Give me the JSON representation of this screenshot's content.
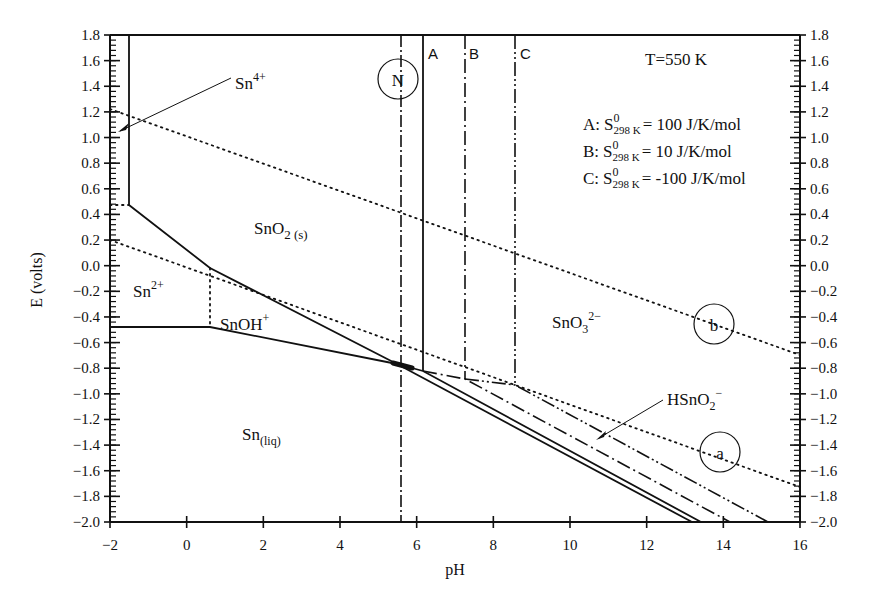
{
  "chart_data": {
    "type": "line",
    "title": "",
    "subtitle": "E–pH (Pourbaix) diagram of Sn, T=550 K",
    "xlabel": "pH",
    "ylabel": "E (volts)",
    "xlim": [
      -2,
      16
    ],
    "ylim": [
      -2.0,
      1.8
    ],
    "x_ticks": [
      "-2",
      "0",
      "2",
      "4",
      "6",
      "8",
      "10",
      "12",
      "14",
      "16"
    ],
    "y_ticks": [
      "1.8",
      "1.6",
      "1.4",
      "1.2",
      "1.0",
      "0.8",
      "0.6",
      "0.4",
      "0.2",
      "0.0",
      "-0.2",
      "-0.4",
      "-0.6",
      "-0.8",
      "-1.0",
      "-1.2",
      "-1.4",
      "-1.6",
      "-1.8",
      "-2.0"
    ],
    "grid": false,
    "annotations": {
      "temperature": "T=550 K",
      "neutral_label": "N",
      "water_line_a": "a",
      "water_line_b": "b",
      "line_labels": [
        "A",
        "B",
        "C"
      ],
      "legend": [
        {
          "key": "A:",
          "text": "= 100 J/K/mol"
        },
        {
          "key": "B:",
          "text": "= 10 J/K/mol"
        },
        {
          "key": "C:",
          "text": "= -100 J/K/mol"
        }
      ],
      "entropy_symbol": "S",
      "entropy_sup": "0",
      "entropy_sub": "298 K"
    },
    "regions": [
      {
        "name": "Sn4+",
        "base": "Sn",
        "sup": "4+"
      },
      {
        "name": "SnO2(s)",
        "base": "SnO",
        "sub": "2 (s)"
      },
      {
        "name": "Sn2+",
        "base": "Sn",
        "sup": "2+"
      },
      {
        "name": "SnOH+",
        "base": "SnOH",
        "sup": "+"
      },
      {
        "name": "Sn(liq)",
        "base": "Sn",
        "sub": "(liq)"
      },
      {
        "name": "SnO3 2-",
        "base": "SnO",
        "sub": "3",
        "sup": "2−"
      },
      {
        "name": "HSnO2-",
        "base": "HSnO",
        "sub": "2",
        "sup": "−"
      }
    ],
    "series": [
      {
        "name": "Sn4+/SnO2 boundary",
        "style": "solid",
        "points": [
          [
            -1.5,
            1.8
          ],
          [
            -1.5,
            0.47
          ]
        ]
      },
      {
        "name": "Sn2+/SnO2 boundary",
        "style": "solid",
        "points": [
          [
            -1.5,
            0.47
          ],
          [
            0.6,
            0.02
          ],
          [
            5.5,
            -0.77
          ]
        ]
      },
      {
        "name": "Sn2+/Sn boundary",
        "style": "solid",
        "points": [
          [
            -2,
            -0.5
          ],
          [
            0.6,
            -0.5
          ],
          [
            5.5,
            -0.77
          ]
        ]
      },
      {
        "name": "Sn2+/SnOH+ boundary",
        "style": "dotted",
        "points": [
          [
            0.6,
            0.02
          ],
          [
            0.6,
            -0.5
          ]
        ]
      },
      {
        "name": "water line b (O2/H2O)",
        "style": "dotted",
        "points": [
          [
            -2,
            1.22
          ],
          [
            16,
            -0.7
          ]
        ]
      },
      {
        "name": "water line a (H+/H2)",
        "style": "dotted",
        "points": [
          [
            -2,
            0.2
          ],
          [
            16,
            -1.73
          ]
        ]
      },
      {
        "name": "A: SnO2/SnO3 2- vertical",
        "style": "solid",
        "points": [
          [
            6.15,
            1.8
          ],
          [
            6.15,
            -0.82
          ]
        ]
      },
      {
        "name": "A: SnO3 2-/Sn boundary",
        "style": "solid",
        "points": [
          [
            5.5,
            -0.77
          ],
          [
            6.15,
            -0.82
          ],
          [
            13.25,
            -2.0
          ]
        ]
      },
      {
        "name": "A: HSnO2- lower boundary",
        "style": "solid",
        "points": [
          [
            5.5,
            -0.77
          ],
          [
            13.0,
            -2.0
          ]
        ]
      },
      {
        "name": "B: vertical",
        "style": "dash-dot",
        "points": [
          [
            7.25,
            1.8
          ],
          [
            7.25,
            -0.88
          ]
        ]
      },
      {
        "name": "B: boundary",
        "style": "dash-dot",
        "points": [
          [
            6.15,
            -0.82
          ],
          [
            7.25,
            -0.88
          ],
          [
            14.0,
            -2.0
          ]
        ]
      },
      {
        "name": "C: vertical",
        "style": "dash-dot-dot",
        "points": [
          [
            8.55,
            1.8
          ],
          [
            8.55,
            -0.93
          ]
        ]
      },
      {
        "name": "C: boundary",
        "style": "dash-dot-dot",
        "points": [
          [
            7.25,
            -0.88
          ],
          [
            8.55,
            -0.93
          ],
          [
            15.0,
            -2.0
          ]
        ]
      },
      {
        "name": "N: neutral pH",
        "style": "dash-dot",
        "points": [
          [
            5.6,
            1.8
          ],
          [
            5.6,
            -2.0
          ]
        ]
      }
    ]
  }
}
